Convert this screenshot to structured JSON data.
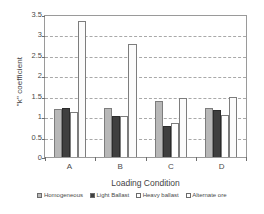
{
  "chart_data": {
    "type": "bar",
    "title": "",
    "xlabel": "Loading Condition",
    "ylabel": "\"k\" coefficient",
    "categories": [
      "A",
      "B",
      "C",
      "D"
    ],
    "ylim": [
      0,
      3.5
    ],
    "yticks": [
      0,
      0.5,
      1,
      1.5,
      2,
      2.5,
      3,
      3.5
    ],
    "ytick_labels": [
      "0",
      "0.5",
      "1",
      "1.5",
      "2",
      "2.5",
      "3",
      "3.5"
    ],
    "grid": true,
    "legend_position": "bottom",
    "series": [
      {
        "name": "Homogeneous",
        "color": "#b8b8b8",
        "values": [
          1.17,
          1.2,
          1.38,
          1.21
        ]
      },
      {
        "name": "Light Ballast",
        "color": "#3f3f3f",
        "values": [
          1.21,
          1.0,
          0.77,
          1.15
        ]
      },
      {
        "name": "Heavy ballast",
        "color": "#ffffff",
        "values": [
          1.1,
          1.01,
          0.83,
          1.04
        ]
      },
      {
        "name": "Alternate ore",
        "color": "#ffffff",
        "values": [
          3.33,
          2.77,
          1.45,
          1.46
        ]
      }
    ]
  }
}
